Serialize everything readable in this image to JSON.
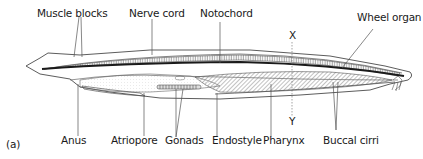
{
  "figure": {
    "panel_label": "(a)",
    "colors": {
      "outline": "#4a4a4a",
      "label_text": "#1a1a1a",
      "leader_line": "#555555",
      "notochord": "#1a1a1a"
    }
  },
  "labels": {
    "top": [
      {
        "id": "muscle-blocks",
        "text": "Muscle blocks"
      },
      {
        "id": "nerve-cord",
        "text": "Nerve cord"
      },
      {
        "id": "notochord",
        "text": "Notochord"
      },
      {
        "id": "wheel-organ",
        "text": "Wheel organ"
      }
    ],
    "bottom": [
      {
        "id": "anus",
        "text": "Anus"
      },
      {
        "id": "atriopore",
        "text": "Atriopore"
      },
      {
        "id": "gonads",
        "text": "Gonads"
      },
      {
        "id": "endostyle",
        "text": "Endostyle"
      },
      {
        "id": "pharynx",
        "text": "Pharynx"
      },
      {
        "id": "buccal-cirri",
        "text": "Buccal cirri"
      }
    ],
    "section_markers": {
      "top": "X",
      "bottom": "Y"
    }
  }
}
